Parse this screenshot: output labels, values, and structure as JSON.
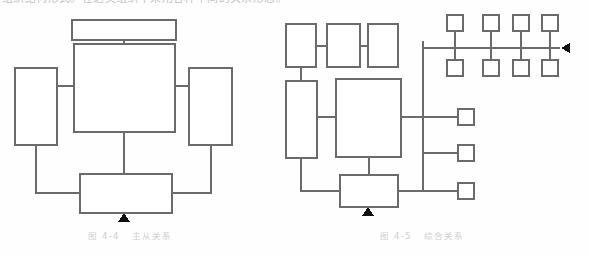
{
  "page": {
    "width": 589,
    "height": 256,
    "background_color": "#fefefe",
    "partial_top_text": "组织结构形式。在这类组织中采用各种不同的关系形态。",
    "ink_color": "#6b6b6b",
    "marker_color": "#111111",
    "caption_color": "#cfcfd3"
  },
  "figures": [
    {
      "id": "fig-4-4",
      "caption_number": "图 4-4",
      "caption_title": "主从关系",
      "description": "master-slave relationship block diagram",
      "nodes": [
        {
          "name": "top-box",
          "x": 72,
          "y": 20,
          "w": 104,
          "h": 20
        },
        {
          "name": "center-box",
          "x": 74,
          "y": 44,
          "w": 101,
          "h": 88
        },
        {
          "name": "left-box",
          "x": 15,
          "y": 68,
          "w": 42,
          "h": 77
        },
        {
          "name": "right-box",
          "x": 189,
          "y": 68,
          "w": 43,
          "h": 77
        },
        {
          "name": "bottom-box",
          "x": 80,
          "y": 174,
          "w": 92,
          "h": 39
        }
      ],
      "marker": {
        "name": "up-triangle",
        "x": 124,
        "y": 215,
        "direction": "up"
      }
    },
    {
      "id": "fig-4-5",
      "caption_number": "图 4-5",
      "caption_title": "综合关系",
      "description": "composite relationship block diagram with bus",
      "nodes": [
        {
          "name": "top-box-1",
          "x": 286,
          "y": 24,
          "w": 30,
          "h": 43
        },
        {
          "name": "top-box-2",
          "x": 327,
          "y": 24,
          "w": 33,
          "h": 43
        },
        {
          "name": "top-box-3",
          "x": 368,
          "y": 24,
          "w": 30,
          "h": 43
        },
        {
          "name": "left-tall-box",
          "x": 286,
          "y": 81,
          "w": 31,
          "h": 77
        },
        {
          "name": "center-box",
          "x": 336,
          "y": 79,
          "w": 65,
          "h": 78
        },
        {
          "name": "bottom-box",
          "x": 340,
          "y": 175,
          "w": 58,
          "h": 32
        }
      ],
      "bus": {
        "name": "vertical-bus",
        "x": 423,
        "y_top": 41,
        "y_bottom": 192,
        "horizontal_bus": {
          "y": 48,
          "x_start": 423,
          "x_end": 560
        }
      },
      "grid_nodes_top_row": [
        {
          "x": 447,
          "y": 15
        },
        {
          "x": 483,
          "y": 15
        },
        {
          "x": 513,
          "y": 15
        },
        {
          "x": 542,
          "y": 15
        }
      ],
      "grid_nodes_bottom_row": [
        {
          "x": 447,
          "y": 60
        },
        {
          "x": 483,
          "y": 60
        },
        {
          "x": 513,
          "y": 60
        },
        {
          "x": 542,
          "y": 60
        }
      ],
      "side_nodes": [
        {
          "x": 458,
          "y": 112
        },
        {
          "x": 458,
          "y": 146
        },
        {
          "x": 458,
          "y": 184
        }
      ],
      "grid_node_size": 16,
      "markers": [
        {
          "name": "up-triangle",
          "x": 368,
          "y": 211,
          "direction": "up"
        },
        {
          "name": "left-triangle",
          "x": 566,
          "y": 48,
          "direction": "left"
        }
      ]
    }
  ]
}
